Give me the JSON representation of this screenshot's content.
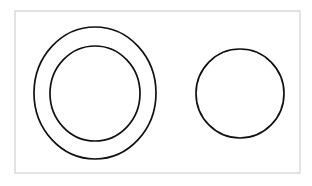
{
  "figure": {
    "canvas": {
      "width": 312,
      "height": 186,
      "background_color": "#ffffff"
    },
    "frame": {
      "name": "figure-border",
      "x": 15,
      "y": 11,
      "width": 285,
      "height": 162,
      "stroke_color": "#c8c8c8",
      "stroke_width": 1,
      "fill_color": "#ffffff"
    },
    "stroke_color": "#111111",
    "stroke_width": 1.6,
    "shapes": [
      {
        "name": "outer-ring-circle",
        "role": "annulus-outer",
        "cx": 95,
        "cy": 93,
        "rx": 61,
        "ry": 66,
        "stroke_color": "#111111",
        "stroke_width": 1.7,
        "fill": "none"
      },
      {
        "name": "inner-ring-circle",
        "role": "annulus-inner",
        "cx": 95,
        "cy": 93.5,
        "rx": 45,
        "ry": 47.5,
        "stroke_color": "#111111",
        "stroke_width": 1.7,
        "fill": "none"
      },
      {
        "name": "right-single-circle",
        "role": "standalone",
        "cx": 240,
        "cy": 93.5,
        "rx": 44,
        "ry": 44.5,
        "stroke_color": "#111111",
        "stroke_width": 1.7,
        "fill": "none"
      }
    ]
  }
}
